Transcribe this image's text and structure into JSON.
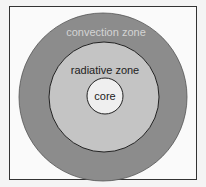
{
  "diagram": {
    "title": "",
    "layers": [
      {
        "label": "convection zone",
        "fill": "#8c8c8c",
        "text_color": "#d4d4d4"
      },
      {
        "label": "radiative zone",
        "fill": "#c4c4c4",
        "text_color": "#222222"
      },
      {
        "label": "core",
        "fill": "#efefef",
        "text_color": "#222222"
      }
    ],
    "stroke": "#222222",
    "frame_border": "#333333"
  }
}
